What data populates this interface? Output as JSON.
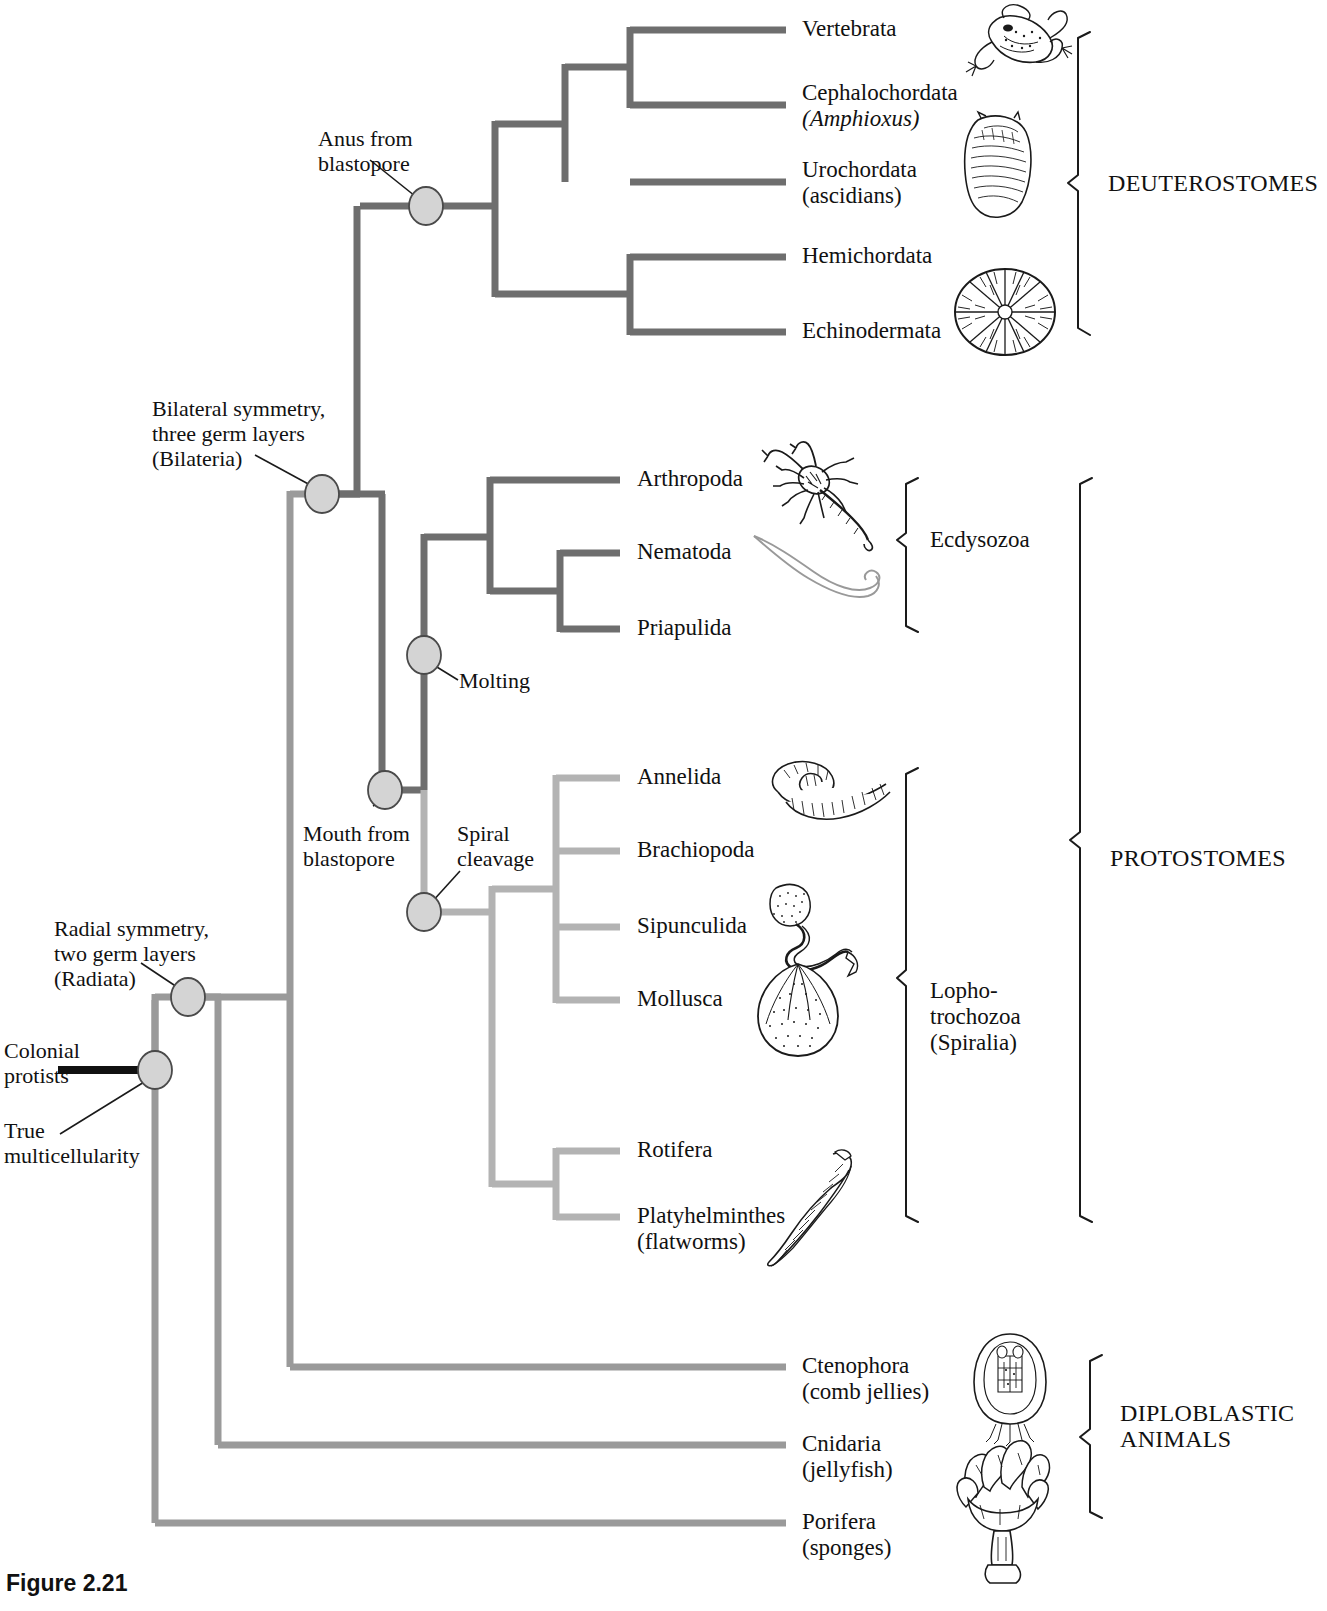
{
  "figure": {
    "caption": "Figure 2.21"
  },
  "colors": {
    "dark_branch": "#6e6e6e",
    "light_branch": "#b3b3b3",
    "node_fill": "#d4d4d4",
    "node_stroke": "#4a4a4a",
    "bracket": "#1a1a1a",
    "root_stem": "#111111"
  },
  "taxa": [
    {
      "name": "Vertebrata",
      "sub": "",
      "x": 802,
      "y": 30,
      "tip_x": 786,
      "group": "deuterostomes"
    },
    {
      "name": "Cephalochordata",
      "sub": "(Amphioxus)",
      "sub_italic": true,
      "x": 802,
      "y": 105,
      "tip_x": 786,
      "group": "deuterostomes"
    },
    {
      "name": "Urochordata",
      "sub": "(ascidians)",
      "x": 802,
      "y": 182,
      "tip_x": 786,
      "group": "deuterostomes"
    },
    {
      "name": "Hemichordata",
      "sub": "",
      "x": 802,
      "y": 257,
      "tip_x": 786,
      "group": "deuterostomes"
    },
    {
      "name": "Echinodermata",
      "sub": "",
      "x": 802,
      "y": 332,
      "tip_x": 786,
      "group": "deuterostomes"
    },
    {
      "name": "Arthropoda",
      "sub": "",
      "x": 637,
      "y": 480,
      "tip_x": 620,
      "group": "ecdysozoa"
    },
    {
      "name": "Nematoda",
      "sub": "",
      "x": 637,
      "y": 553,
      "tip_x": 620,
      "group": "ecdysozoa"
    },
    {
      "name": "Priapulida",
      "sub": "",
      "x": 637,
      "y": 629,
      "tip_x": 620,
      "group": "ecdysozoa"
    },
    {
      "name": "Annelida",
      "sub": "",
      "x": 637,
      "y": 778,
      "tip_x": 620,
      "group": "lophotrochozoa"
    },
    {
      "name": "Brachiopoda",
      "sub": "",
      "x": 637,
      "y": 851,
      "tip_x": 620,
      "group": "lophotrochozoa"
    },
    {
      "name": "Sipunculida",
      "sub": "",
      "x": 637,
      "y": 927,
      "tip_x": 620,
      "group": "lophotrochozoa"
    },
    {
      "name": "Mollusca",
      "sub": "",
      "x": 637,
      "y": 1000,
      "tip_x": 620,
      "group": "lophotrochozoa"
    },
    {
      "name": "Rotifera",
      "sub": "",
      "x": 637,
      "y": 1151,
      "tip_x": 620,
      "group": "lophotrochozoa"
    },
    {
      "name": "Platyhelminthes",
      "sub": "(flatworms)",
      "x": 637,
      "y": 1217,
      "tip_x": 620,
      "group": "lophotrochozoa"
    },
    {
      "name": "Ctenophora",
      "sub": "(comb jellies)",
      "x": 802,
      "y": 1367,
      "tip_x": 786,
      "group": "diploblastic"
    },
    {
      "name": "Cnidaria",
      "sub": "(jellyfish)",
      "x": 802,
      "y": 1445,
      "tip_x": 786,
      "group": "diploblastic"
    },
    {
      "name": "Porifera",
      "sub": "(sponges)",
      "x": 802,
      "y": 1523,
      "tip_x": 786,
      "group": "basal"
    }
  ],
  "nodes": [
    {
      "id": "anus-from-blastopore",
      "label": "Anus from\nblastopore",
      "label_line1": "Anus from",
      "label_line2": "blastopore",
      "cx": 426,
      "cy": 206,
      "label_x": 318,
      "label_y": 128
    },
    {
      "id": "bilateria",
      "label_line1": "Bilateral symmetry,",
      "label_line2": "three germ layers",
      "label_line3": "(Bilateria)",
      "cx": 322,
      "cy": 494,
      "label_x": 152,
      "label_y": 398
    },
    {
      "id": "molting",
      "label_line1": "Molting",
      "cx": 424,
      "cy": 655,
      "label_x": 459,
      "label_y": 673
    },
    {
      "id": "mouth-from-blastopore",
      "label_line1": "Mouth from",
      "label_line2": "blastopore",
      "cx": 385,
      "cy": 790,
      "label_x": 303,
      "label_y": 825
    },
    {
      "id": "spiral-cleavage",
      "label_line1": "Spiral",
      "label_line2": "cleavage",
      "cx": 424,
      "cy": 912,
      "label_x": 457,
      "label_y": 825
    },
    {
      "id": "radiata",
      "label_line1": "Radial symmetry,",
      "label_line2": "two germ layers",
      "label_line3": "(Radiata)",
      "cx": 188,
      "cy": 997,
      "label_x": 54,
      "label_y": 920
    },
    {
      "id": "true-multicellularity",
      "label_line1": "Colonial",
      "label_line2": "protists",
      "cx": 155,
      "cy": 1070,
      "label_x": 4,
      "label_y": 1040,
      "second_label_line1": "True",
      "second_label_line2": "multicellularity",
      "second_label_x": 4,
      "second_label_y": 1122
    }
  ],
  "group_brackets": [
    {
      "id": "deuterostomes",
      "label": "DEUTEROSTOMES",
      "caps": true,
      "label_x": 1108,
      "label_y": 165,
      "x": 1080,
      "y1": 32,
      "y2": 335
    },
    {
      "id": "ecdysozoa",
      "label": "Ecdysozoa",
      "caps": false,
      "label_x": 930,
      "label_y": 540,
      "x": 908,
      "y1": 478,
      "y2": 632
    },
    {
      "id": "lophotrochozoa",
      "label_line1": "Lopho-",
      "label_line2": "trochozoa",
      "label_line3": "(Spiralia)",
      "caps": false,
      "label_x": 930,
      "label_y": 978,
      "x": 908,
      "y1": 768,
      "y2": 1222
    },
    {
      "id": "protostomes",
      "label": "PROTOSTOMES",
      "caps": true,
      "label_x": 1108,
      "label_y": 840,
      "x": 1082,
      "y1": 478,
      "y2": 1222
    },
    {
      "id": "diploblastic",
      "label_line1": "DIPLOBLASTIC",
      "label_line2": "ANIMALS",
      "caps": true,
      "label_x": 1120,
      "label_y": 1400,
      "x": 1092,
      "y1": 1355,
      "y2": 1518
    }
  ],
  "organism_illustrations": [
    {
      "id": "frog-illustration",
      "taxon": "Vertebrata",
      "x": 952,
      "y": 2,
      "w": 120,
      "h": 75
    },
    {
      "id": "ascidian-illustration",
      "taxon": "Urochordata",
      "x": 948,
      "y": 110,
      "w": 95,
      "h": 115
    },
    {
      "id": "sea-urchin-illustration",
      "taxon": "Echinodermata",
      "x": 950,
      "y": 265,
      "w": 110,
      "h": 95
    },
    {
      "id": "scorpion-illustration",
      "taxon": "Arthropoda",
      "x": 760,
      "y": 440,
      "w": 125,
      "h": 110
    },
    {
      "id": "nematode-illustration",
      "taxon": "Nematoda",
      "x": 748,
      "y": 530,
      "w": 140,
      "h": 75
    },
    {
      "id": "earthworm-illustration",
      "taxon": "Annelida",
      "x": 760,
      "y": 748,
      "w": 130,
      "h": 80
    },
    {
      "id": "sipunculid-illustration",
      "taxon": "Sipunculida",
      "x": 748,
      "y": 878,
      "w": 130,
      "h": 100
    },
    {
      "id": "mollusc-illustration",
      "taxon": "Mollusca",
      "x": 750,
      "y": 958,
      "w": 100,
      "h": 105
    },
    {
      "id": "flatworm-illustration",
      "taxon": "Platyhelminthes",
      "x": 765,
      "y": 1150,
      "w": 105,
      "h": 115
    },
    {
      "id": "ctenophore-illustration",
      "taxon": "Ctenophora",
      "x": 960,
      "y": 1330,
      "w": 100,
      "h": 115
    },
    {
      "id": "sponge-illustration",
      "taxon": "Porifera",
      "x": 950,
      "y": 1435,
      "w": 105,
      "h": 160
    }
  ],
  "tree_geometry": {
    "root_stem": {
      "x1": 58,
      "y1": 1070,
      "x2": 155,
      "y2": 1070
    },
    "trunk_x_root": 155,
    "trunk_x_radiata": 188,
    "trunk_x_bilateria_stem": 290,
    "trunk_x_bilateria": 322,
    "trunk_x_protostome": 385,
    "trunk_x_spiral": 424,
    "porifera_y": 1523,
    "cnidaria_y": 1445,
    "ctenophora_y": 1367
  }
}
